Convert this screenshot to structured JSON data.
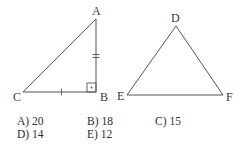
{
  "figure": {
    "triangle_abc": {
      "vertices": {
        "A": {
          "label": "A",
          "x": 96,
          "y": 19
        },
        "B": {
          "label": "B",
          "x": 96,
          "y": 92
        },
        "C": {
          "label": "C",
          "x": 23,
          "y": 92
        }
      },
      "right_angle_at": "B",
      "tick_marks": {
        "AB": "double",
        "CB": "single"
      }
    },
    "triangle_def": {
      "vertices": {
        "D": {
          "label": "D",
          "x": 176,
          "y": 26
        },
        "E": {
          "label": "E",
          "x": 127,
          "y": 95
        },
        "F": {
          "label": "F",
          "x": 223,
          "y": 95
        }
      }
    },
    "stroke_color": "#555555"
  },
  "answers": [
    {
      "key": "A",
      "text": "A) 20"
    },
    {
      "key": "B",
      "text": "B) 18"
    },
    {
      "key": "C",
      "text": "C) 15"
    },
    {
      "key": "D",
      "text": "D) 14"
    },
    {
      "key": "E",
      "text": "E) 12"
    }
  ]
}
